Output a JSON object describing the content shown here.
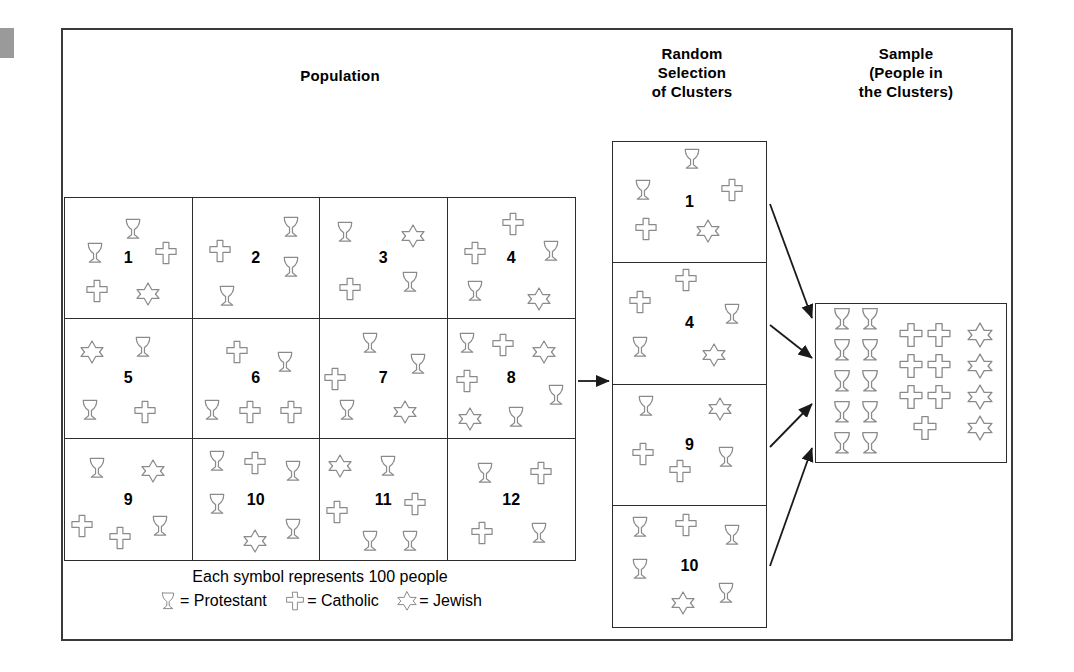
{
  "titles": {
    "population": "Population",
    "random_line1": "Random",
    "random_line2": "Selection",
    "random_line3": "of Clusters",
    "sample_line1": "Sample",
    "sample_line2": "(People in",
    "sample_line3": "the Clusters)"
  },
  "legend": {
    "caption": "Each symbol represents 100 people",
    "protestant": "= Protestant",
    "catholic": "= Catholic",
    "jewish": "= Jewish",
    "symbols": {
      "protestant": "goblet-icon",
      "catholic": "cross-icon",
      "jewish": "star-of-david-icon"
    }
  },
  "colors": {
    "frame": "#3a3a3a",
    "grid": "#2c2c2c",
    "symbol_outline": "#8a8a8a",
    "text": "#000000",
    "background": "#ffffff"
  },
  "population": {
    "rows": 3,
    "cols": 4,
    "cells": [
      {
        "number": "1",
        "symbols": [
          {
            "type": "goblet",
            "x": 14,
            "y": 36
          },
          {
            "type": "goblet",
            "x": 44,
            "y": 16
          },
          {
            "type": "cross",
            "x": 70,
            "y": 36
          },
          {
            "type": "cross",
            "x": 16,
            "y": 68
          },
          {
            "type": "star",
            "x": 56,
            "y": 70
          }
        ]
      },
      {
        "number": "2",
        "symbols": [
          {
            "type": "cross",
            "x": 12,
            "y": 34
          },
          {
            "type": "goblet",
            "x": 68,
            "y": 14
          },
          {
            "type": "goblet",
            "x": 68,
            "y": 48
          },
          {
            "type": "goblet",
            "x": 18,
            "y": 72
          }
        ]
      },
      {
        "number": "3",
        "symbols": [
          {
            "type": "goblet",
            "x": 10,
            "y": 18
          },
          {
            "type": "star",
            "x": 64,
            "y": 22
          },
          {
            "type": "cross",
            "x": 14,
            "y": 66
          },
          {
            "type": "goblet",
            "x": 62,
            "y": 60
          }
        ]
      },
      {
        "number": "4",
        "symbols": [
          {
            "type": "cross",
            "x": 42,
            "y": 12
          },
          {
            "type": "cross",
            "x": 12,
            "y": 36
          },
          {
            "type": "goblet",
            "x": 72,
            "y": 34
          },
          {
            "type": "goblet",
            "x": 12,
            "y": 68
          },
          {
            "type": "star",
            "x": 62,
            "y": 74
          }
        ]
      },
      {
        "number": "5",
        "symbols": [
          {
            "type": "star",
            "x": 12,
            "y": 18
          },
          {
            "type": "goblet",
            "x": 52,
            "y": 14
          },
          {
            "type": "goblet",
            "x": 10,
            "y": 66
          },
          {
            "type": "cross",
            "x": 54,
            "y": 68
          }
        ]
      },
      {
        "number": "6",
        "symbols": [
          {
            "type": "cross",
            "x": 26,
            "y": 18
          },
          {
            "type": "goblet",
            "x": 64,
            "y": 26
          },
          {
            "type": "goblet",
            "x": 6,
            "y": 66
          },
          {
            "type": "cross",
            "x": 36,
            "y": 68
          },
          {
            "type": "cross",
            "x": 68,
            "y": 68
          }
        ]
      },
      {
        "number": "7",
        "symbols": [
          {
            "type": "goblet",
            "x": 30,
            "y": 10
          },
          {
            "type": "goblet",
            "x": 68,
            "y": 28
          },
          {
            "type": "cross",
            "x": 2,
            "y": 40
          },
          {
            "type": "goblet",
            "x": 12,
            "y": 66
          },
          {
            "type": "star",
            "x": 58,
            "y": 68
          }
        ]
      },
      {
        "number": "8",
        "symbols": [
          {
            "type": "goblet",
            "x": 6,
            "y": 10
          },
          {
            "type": "cross",
            "x": 34,
            "y": 12
          },
          {
            "type": "star",
            "x": 66,
            "y": 18
          },
          {
            "type": "cross",
            "x": 6,
            "y": 42
          },
          {
            "type": "goblet",
            "x": 76,
            "y": 54
          },
          {
            "type": "star",
            "x": 8,
            "y": 74
          },
          {
            "type": "goblet",
            "x": 44,
            "y": 72
          }
        ]
      },
      {
        "number": "9",
        "symbols": [
          {
            "type": "goblet",
            "x": 16,
            "y": 14
          },
          {
            "type": "star",
            "x": 60,
            "y": 16
          },
          {
            "type": "cross",
            "x": 4,
            "y": 62
          },
          {
            "type": "cross",
            "x": 34,
            "y": 72
          },
          {
            "type": "goblet",
            "x": 66,
            "y": 62
          }
        ]
      },
      {
        "number": "10",
        "symbols": [
          {
            "type": "goblet",
            "x": 10,
            "y": 8
          },
          {
            "type": "cross",
            "x": 40,
            "y": 10
          },
          {
            "type": "goblet",
            "x": 70,
            "y": 16
          },
          {
            "type": "goblet",
            "x": 10,
            "y": 44
          },
          {
            "type": "star",
            "x": 40,
            "y": 74
          },
          {
            "type": "goblet",
            "x": 70,
            "y": 64
          }
        ]
      },
      {
        "number": "11",
        "symbols": [
          {
            "type": "star",
            "x": 6,
            "y": 12
          },
          {
            "type": "goblet",
            "x": 44,
            "y": 12
          },
          {
            "type": "cross",
            "x": 4,
            "y": 50
          },
          {
            "type": "cross",
            "x": 66,
            "y": 44
          },
          {
            "type": "goblet",
            "x": 30,
            "y": 74
          },
          {
            "type": "goblet",
            "x": 62,
            "y": 74
          }
        ]
      },
      {
        "number": "12",
        "symbols": [
          {
            "type": "goblet",
            "x": 20,
            "y": 18
          },
          {
            "type": "cross",
            "x": 64,
            "y": 18
          },
          {
            "type": "cross",
            "x": 18,
            "y": 68
          },
          {
            "type": "goblet",
            "x": 62,
            "y": 68
          }
        ]
      }
    ]
  },
  "clusters": {
    "selected": [
      {
        "number": "1",
        "symbols": [
          {
            "type": "goblet",
            "x": 44,
            "y": 4
          },
          {
            "type": "goblet",
            "x": 12,
            "y": 30
          },
          {
            "type": "cross",
            "x": 70,
            "y": 30
          },
          {
            "type": "cross",
            "x": 14,
            "y": 62
          },
          {
            "type": "star",
            "x": 54,
            "y": 64
          }
        ]
      },
      {
        "number": "4",
        "symbols": [
          {
            "type": "cross",
            "x": 40,
            "y": 4
          },
          {
            "type": "cross",
            "x": 10,
            "y": 22
          },
          {
            "type": "goblet",
            "x": 70,
            "y": 32
          },
          {
            "type": "goblet",
            "x": 10,
            "y": 60
          },
          {
            "type": "star",
            "x": 58,
            "y": 66
          }
        ]
      },
      {
        "number": "9",
        "symbols": [
          {
            "type": "goblet",
            "x": 14,
            "y": 8
          },
          {
            "type": "star",
            "x": 62,
            "y": 10
          },
          {
            "type": "cross",
            "x": 12,
            "y": 48
          },
          {
            "type": "cross",
            "x": 36,
            "y": 62
          },
          {
            "type": "goblet",
            "x": 66,
            "y": 50
          }
        ]
      },
      {
        "number": "10",
        "symbols": [
          {
            "type": "goblet",
            "x": 10,
            "y": 8
          },
          {
            "type": "cross",
            "x": 40,
            "y": 6
          },
          {
            "type": "goblet",
            "x": 70,
            "y": 14
          },
          {
            "type": "goblet",
            "x": 10,
            "y": 42
          },
          {
            "type": "star",
            "x": 38,
            "y": 70
          },
          {
            "type": "goblet",
            "x": 66,
            "y": 62
          }
        ]
      }
    ]
  },
  "sample": {
    "groups": [
      {
        "type": "goblet",
        "label": "protestant-column",
        "rows": [
          2,
          2,
          2,
          2,
          2
        ]
      },
      {
        "type": "cross",
        "label": "catholic-column",
        "rows": [
          2,
          2,
          2,
          1
        ]
      },
      {
        "type": "star",
        "label": "jewish-column",
        "rows": [
          1,
          1,
          1,
          1
        ]
      }
    ]
  },
  "arrows": {
    "population_to_clusters": "horizontal-arrow",
    "clusters_to_sample_count": 4
  }
}
